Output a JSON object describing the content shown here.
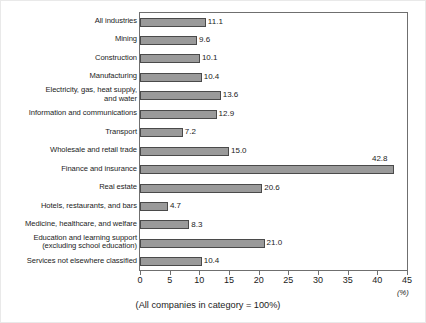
{
  "chart_data": {
    "type": "bar",
    "orientation": "horizontal",
    "title": "",
    "xlabel": "(%)",
    "ylabel": "",
    "xlim": [
      0,
      45
    ],
    "xticks": [
      0,
      5,
      10,
      15,
      20,
      25,
      30,
      35,
      40,
      45
    ],
    "grid": false,
    "legend": null,
    "note": "(All companies in category = 100%)",
    "categories": [
      "All industries",
      "Mining",
      "Construction",
      "Manufacturing",
      "Electricity, gas, heat supply,\nand water",
      "Information and communications",
      "Transport",
      "Wholesale and retail trade",
      "Finance and insurance",
      "Real estate",
      "Hotels, restaurants, and bars",
      "Medicine, healthcare, and welfare",
      "Education and learning support\n(excluding school education)",
      "Services not elsewhere classified"
    ],
    "values": [
      11.1,
      9.6,
      10.1,
      10.4,
      13.6,
      12.9,
      7.2,
      15.0,
      42.8,
      20.6,
      4.7,
      8.3,
      21.0,
      10.4
    ],
    "value_labels": [
      "11.1",
      "9.6",
      "10.1",
      "10.4",
      "13.6",
      "12.9",
      "7.2",
      "15.0",
      "42.8",
      "20.6",
      "4.7",
      "8.3",
      "21.0",
      "10.4"
    ],
    "bar_color": "#9a9a9a",
    "bar_edge_color": "#4a4a4a",
    "axis_color": "#6f6f6f",
    "text_color": "#1b1b1b"
  }
}
